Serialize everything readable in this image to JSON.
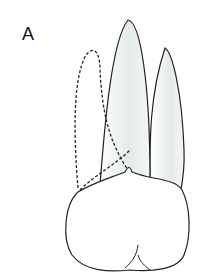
{
  "figure": {
    "panel_label": "A",
    "colors": {
      "stroke": "#222222",
      "shade": "#e6ecec",
      "background": "#ffffff"
    }
  }
}
